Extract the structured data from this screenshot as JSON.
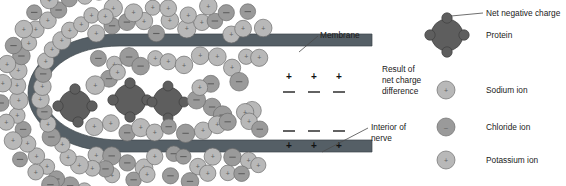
{
  "figure": {
    "background_color": "#ffffff"
  },
  "colors": {
    "membrane": "#555f66",
    "membrane_edge": "#3e464b",
    "protein": "#5e5e5e",
    "protein_edge": "#3f3f3f",
    "ion_positive": "#b8b8b8",
    "ion_negative": "#9a9a9a",
    "ion_edge": "#6e6e6e",
    "text": "#1a1a1a",
    "leader_line": "#4a4a4a",
    "charge_plus": "#1f1f1f",
    "charge_minus": "#1f1f1f"
  },
  "callouts": [
    {
      "id": "membrane",
      "label": "Membrane"
    },
    {
      "id": "result-of-net-charge-difference",
      "lines": [
        "Result of",
        "net charge",
        "difference"
      ]
    },
    {
      "id": "interior-of-nerve",
      "lines": [
        "Interior of",
        "nerve"
      ]
    }
  ],
  "membrane_charges": {
    "outer_band": {
      "inside_symbols": [
        "+",
        "+",
        "+"
      ],
      "outside_symbols": [
        "–",
        "–",
        "–"
      ]
    },
    "inner_band": {
      "inside_symbols": [
        "+",
        "+",
        "+"
      ],
      "outside_symbols": [
        "–",
        "–",
        "–"
      ]
    }
  },
  "legend": {
    "items": [
      {
        "key": "protein",
        "icon": "protein-lobed-circle-icon",
        "label": "Protein",
        "annotation": "Net negative charge",
        "annotation_target": "net-negative-charge-lobe"
      },
      {
        "key": "sodium",
        "icon": "ion-circle-icon",
        "symbol": "+",
        "label": "Sodium ion"
      },
      {
        "key": "chloride",
        "icon": "ion-circle-icon",
        "symbol": "–",
        "label": "Chloride ion"
      },
      {
        "key": "potassium",
        "icon": "ion-circle-icon",
        "symbol": "+",
        "label": "Potassium ion"
      }
    ]
  },
  "chart_data": {
    "type": "diagram",
    "elements": {
      "membrane_bands": 2,
      "proteins_in_nerve": 3,
      "legend_entries": 4
    },
    "charge_layout": {
      "interior_side": "+",
      "exterior_side": "–",
      "charges_per_band": 3
    },
    "ion_species": [
      "Sodium ion",
      "Chloride ion",
      "Potassium ion"
    ]
  }
}
